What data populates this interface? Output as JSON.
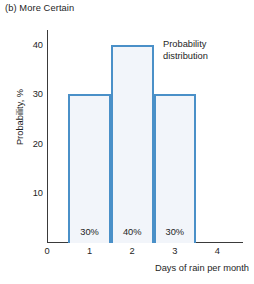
{
  "figure": {
    "panel_caption": "(b) More Certain",
    "background_color": "#ffffff"
  },
  "annotation": {
    "line1": "Probability",
    "line2": "distribution"
  },
  "chart_data": {
    "type": "bar",
    "title": "(b) More Certain",
    "xlabel": "Days of rain per month",
    "ylabel": "Probability, %",
    "categories": [
      "1",
      "2",
      "3"
    ],
    "values": [
      30,
      40,
      30
    ],
    "data_labels": [
      "30%",
      "40%",
      "30%"
    ],
    "bar_edges": [
      [
        0.5,
        1.5
      ],
      [
        1.5,
        2.5
      ],
      [
        2.5,
        3.5
      ]
    ],
    "xlim": [
      0,
      4.6
    ],
    "ylim": [
      0,
      43
    ],
    "xticks": [
      "0",
      "1",
      "2",
      "3",
      "4"
    ],
    "xtick_values": [
      0,
      1,
      2,
      3,
      4
    ],
    "yticks": [
      "10",
      "20",
      "30",
      "40"
    ],
    "ytick_values": [
      10,
      20,
      30,
      40
    ],
    "grid": false,
    "legend": false,
    "annotations": [
      "Probability distribution"
    ],
    "bar_edge_color": "#4a90c8",
    "bar_fill_color": "#f2f5fa",
    "axis_color": "#3a3a3a"
  }
}
